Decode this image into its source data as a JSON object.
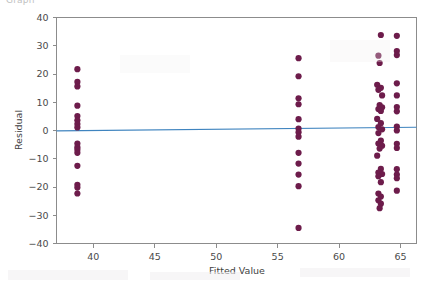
{
  "caption": {
    "clipped_text": "Graph"
  },
  "chart_data": {
    "type": "scatter",
    "title": "",
    "subtitle": "",
    "xlabel": "Fitted Value",
    "ylabel": "Residual",
    "xlim": [
      37.0,
      66.3
    ],
    "ylim": [
      -40,
      40
    ],
    "xticks": [
      40,
      45,
      50,
      55,
      60,
      65
    ],
    "xtick_labels": [
      "40",
      "45",
      "50",
      "55",
      "60",
      "65"
    ],
    "yticks": [
      40,
      30,
      20,
      10,
      0,
      -10,
      -20,
      -30,
      -40
    ],
    "ytick_labels": [
      "40",
      "30",
      "20",
      "10",
      "0",
      "-10",
      "-20",
      "-30",
      "-40"
    ],
    "grid": false,
    "legend": null,
    "marker_color": "#6d1c4b",
    "marker_size": 3.1,
    "reference_line": {
      "name": "fitted-zero-line",
      "color": "#3f84bf",
      "x": [
        37.0,
        66.3
      ],
      "y": [
        -0.15,
        1.15
      ]
    },
    "series": [
      {
        "name": "Residuals",
        "points": [
          [
            38.7,
            21.7
          ],
          [
            38.7,
            17.2
          ],
          [
            38.7,
            15.6
          ],
          [
            38.7,
            8.8
          ],
          [
            38.7,
            5.1
          ],
          [
            38.7,
            3.6
          ],
          [
            38.7,
            2.3
          ],
          [
            38.7,
            1.1
          ],
          [
            38.7,
            -4.6
          ],
          [
            38.7,
            -5.9
          ],
          [
            38.7,
            -6.8
          ],
          [
            38.7,
            -7.9
          ],
          [
            38.7,
            -12.5
          ],
          [
            38.7,
            -19.2
          ],
          [
            38.7,
            -20.2
          ],
          [
            38.7,
            -22.3
          ],
          [
            56.7,
            25.6
          ],
          [
            56.7,
            19.2
          ],
          [
            56.7,
            11.4
          ],
          [
            56.7,
            9.3
          ],
          [
            56.7,
            4.0
          ],
          [
            56.7,
            0.7
          ],
          [
            56.7,
            -0.6
          ],
          [
            56.7,
            -2.2
          ],
          [
            56.7,
            -7.9
          ],
          [
            56.7,
            -11.7
          ],
          [
            56.7,
            -15.6
          ],
          [
            56.7,
            -19.7
          ],
          [
            56.7,
            -34.5
          ],
          [
            63.4,
            33.8
          ],
          [
            63.2,
            26.5
          ],
          [
            63.3,
            23.9
          ],
          [
            63.1,
            16.2
          ],
          [
            63.4,
            15.1
          ],
          [
            63.2,
            14.4
          ],
          [
            63.5,
            12.4
          ],
          [
            63.3,
            9.0
          ],
          [
            63.5,
            8.2
          ],
          [
            63.2,
            7.6
          ],
          [
            63.4,
            6.9
          ],
          [
            63.1,
            4.1
          ],
          [
            63.4,
            2.6
          ],
          [
            63.2,
            1.2
          ],
          [
            63.5,
            0.4
          ],
          [
            63.2,
            -0.9
          ],
          [
            63.4,
            -3.6
          ],
          [
            63.2,
            -4.6
          ],
          [
            63.5,
            -5.4
          ],
          [
            63.3,
            -6.4
          ],
          [
            63.1,
            -8.9
          ],
          [
            63.4,
            -13.6
          ],
          [
            63.2,
            -14.9
          ],
          [
            63.5,
            -15.4
          ],
          [
            63.2,
            -16.2
          ],
          [
            63.4,
            -18.3
          ],
          [
            63.2,
            -22.3
          ],
          [
            63.4,
            -23.4
          ],
          [
            63.2,
            -24.7
          ],
          [
            63.4,
            -25.9
          ],
          [
            63.3,
            -27.5
          ],
          [
            64.7,
            33.5
          ],
          [
            64.7,
            28.1
          ],
          [
            64.7,
            26.7
          ],
          [
            64.7,
            16.7
          ],
          [
            64.7,
            12.4
          ],
          [
            64.7,
            8.3
          ],
          [
            64.7,
            6.8
          ],
          [
            64.7,
            1.4
          ],
          [
            64.7,
            0.0
          ],
          [
            64.7,
            -4.7
          ],
          [
            64.7,
            -6.2
          ],
          [
            64.7,
            -13.7
          ],
          [
            64.7,
            -15.6
          ],
          [
            64.7,
            -16.9
          ],
          [
            64.7,
            -21.3
          ]
        ]
      }
    ]
  }
}
